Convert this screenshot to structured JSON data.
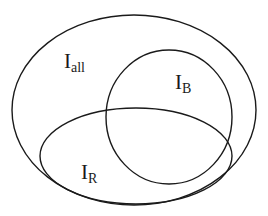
{
  "diagram": {
    "type": "venn",
    "stroke_color": "#1a1a1a",
    "background": "#ffffff",
    "sets": [
      {
        "id": "all",
        "label_main": "I",
        "label_sub": "all",
        "shape": "ellipse",
        "cx": 134,
        "cy": 110,
        "rx": 122,
        "ry": 95,
        "label_x": 64,
        "label_y": 68
      },
      {
        "id": "B",
        "label_main": "I",
        "label_sub": "B",
        "shape": "ellipse",
        "cx": 169,
        "cy": 117,
        "rx": 63,
        "ry": 67,
        "label_x": 175,
        "label_y": 89
      },
      {
        "id": "R",
        "label_main": "I",
        "label_sub": "R",
        "shape": "ellipse",
        "cx": 136,
        "cy": 156,
        "rx": 96,
        "ry": 48,
        "label_x": 81,
        "label_y": 179
      }
    ]
  }
}
